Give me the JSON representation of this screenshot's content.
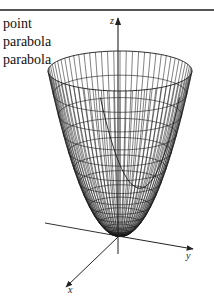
{
  "text_labels": [
    "point",
    "parabola",
    "parabola"
  ],
  "axes": {
    "z": {
      "label": "z"
    },
    "y": {
      "label": "y"
    },
    "x": {
      "label": "x"
    }
  },
  "figure": {
    "type": "paraboloid wireframe",
    "equation_hint": "z = x^2 + y^2",
    "stroke_color": "#1a1a1a",
    "axis_color": "#333333"
  }
}
